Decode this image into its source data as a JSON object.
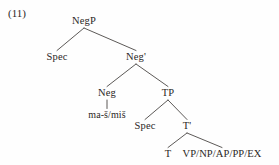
{
  "figure": {
    "example_number": "(11)",
    "ink_color": "#2b2725",
    "line_color": "#4a4644",
    "background_color": "#fefefe",
    "width": 279,
    "height": 165
  },
  "tree": {
    "nodes": [
      {
        "id": "negp",
        "label": "NegP",
        "x": 84,
        "y": 16
      },
      {
        "id": "spec1",
        "label": "Spec",
        "x": 57,
        "y": 52
      },
      {
        "id": "negbar",
        "label": "Neg'",
        "x": 136,
        "y": 52
      },
      {
        "id": "neg",
        "label": "Neg",
        "x": 107,
        "y": 88
      },
      {
        "id": "maš",
        "label": "ma-š/miš",
        "x": 107,
        "y": 110
      },
      {
        "id": "tp",
        "label": "TP",
        "x": 168,
        "y": 88
      },
      {
        "id": "spec2",
        "label": "Spec",
        "x": 145,
        "y": 121
      },
      {
        "id": "tbar",
        "label": "T'",
        "x": 187,
        "y": 121
      },
      {
        "id": "t",
        "label": "T",
        "x": 168,
        "y": 149
      },
      {
        "id": "comp",
        "label": "VP/NP/AP/PP/EX",
        "x": 222,
        "y": 149
      }
    ],
    "edges": [
      {
        "id": "negp-spec1",
        "from": "negp",
        "to": "spec1"
      },
      {
        "id": "negp-negbar",
        "from": "negp",
        "to": "negbar"
      },
      {
        "id": "negbar-neg",
        "from": "negbar",
        "to": "neg"
      },
      {
        "id": "negbar-tp",
        "from": "negbar",
        "to": "tp"
      },
      {
        "id": "neg-mas",
        "from": "neg",
        "to": "maš"
      },
      {
        "id": "tp-spec2",
        "from": "tp",
        "to": "spec2"
      },
      {
        "id": "tp-tbar",
        "from": "tp",
        "to": "tbar"
      },
      {
        "id": "tbar-t",
        "from": "tbar",
        "to": "t"
      },
      {
        "id": "tbar-comp",
        "from": "tbar",
        "to": "comp"
      }
    ]
  }
}
